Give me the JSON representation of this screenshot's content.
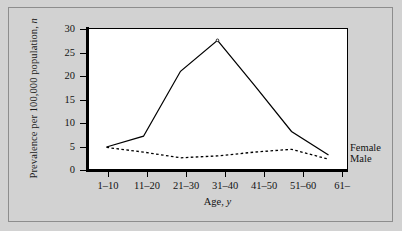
{
  "figure": {
    "background_color": "#d2d2d2",
    "plot_background_color": "#ffffff",
    "frame_color": "#8d8d8d",
    "axis_color": "#000000"
  },
  "axes": {
    "y_title_prefix": "Prevalence per 100,000 population, ",
    "y_title_italic": "n",
    "x_title_prefix": "Age, ",
    "x_title_italic": "y",
    "y_ticks": [
      "0",
      "5",
      "10",
      "15",
      "20",
      "25",
      "30"
    ],
    "x_ticks": [
      "1–10",
      "11–20",
      "21–30",
      "31–40",
      "41–50",
      "51–60",
      "61–"
    ]
  },
  "series_labels": {
    "female": "Female",
    "male": "Male"
  },
  "chart_data": {
    "type": "line",
    "title": "",
    "xlabel": "Age, y",
    "ylabel": "Prevalence per 100,000 population, n",
    "categories": [
      "1–10",
      "11–20",
      "21–30",
      "31–40",
      "41–50",
      "51–60",
      "61–"
    ],
    "series": [
      {
        "name": "Female",
        "style": "solid",
        "color": "#000000",
        "values": [
          4.9,
          7.2,
          21.0,
          27.6,
          18.0,
          8.2,
          3.2
        ]
      },
      {
        "name": "Male",
        "style": "dashed",
        "color": "#000000",
        "values": [
          4.8,
          3.8,
          2.6,
          3.0,
          3.8,
          4.4,
          2.3
        ]
      }
    ],
    "ylim": [
      0,
      30
    ],
    "ytick_step": 5,
    "grid": false,
    "legend": "inline-right-end-labels"
  }
}
